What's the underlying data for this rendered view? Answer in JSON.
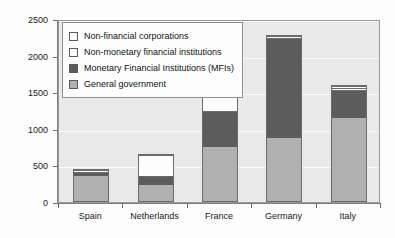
{
  "chart_data": {
    "type": "bar",
    "subtype": "stacked-bar",
    "title": "",
    "xlabel": "",
    "ylabel": "",
    "ylim": [
      0,
      2500
    ],
    "ytick_values": [
      0,
      500,
      1000,
      1500,
      2000,
      2500
    ],
    "ytick_labels": [
      "0",
      "500",
      "1000",
      "1500",
      "2000",
      "2500"
    ],
    "grid": true,
    "legend_position": "top-left-inside",
    "categories": [
      "Spain",
      "Netherlands",
      "France",
      "Germany",
      "Italy"
    ],
    "series": [
      {
        "name": "General government",
        "color": "#b0b0b0",
        "values": [
          370,
          230,
          750,
          870,
          1160
        ]
      },
      {
        "name": "Monetary Financial Institutions (MFIs)",
        "color": "#5c5c5c",
        "values": [
          55,
          130,
          500,
          1380,
          390
        ]
      },
      {
        "name": "Non-monetary financial institutions",
        "color": "#fdfdfd",
        "values": [
          25,
          290,
          250,
          30,
          25
        ]
      },
      {
        "name": "Non-financial corporations",
        "color": "#fdfdfd",
        "values": [
          0,
          0,
          0,
          0,
          25
        ]
      }
    ],
    "totals": [
      450,
      650,
      1500,
      2280,
      1600
    ]
  },
  "legend": {
    "items": [
      {
        "label": "Non-financial corporations",
        "swatch": "legend-swatch-non-financial-corporations"
      },
      {
        "label": "Non-monetary financial institutions",
        "swatch": "legend-swatch-non-monetary-financial-institutions"
      },
      {
        "label": "Monetary Financial Institutions (MFIs)",
        "swatch": "legend-swatch-mfis"
      },
      {
        "label": "General government",
        "swatch": "legend-swatch-general-government"
      }
    ]
  },
  "colors": {
    "general_government": "#b0b0b0",
    "mfis": "#5c5c5c",
    "non_monetary": "#fdfdfd",
    "non_financial": "#fdfdfd",
    "plot_background": "#e9e9e9",
    "gridline": "#fbfbfb",
    "axis": "#7d7d7d"
  }
}
